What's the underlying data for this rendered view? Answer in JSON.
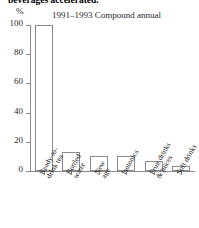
{
  "headline": "beverages accelerated.",
  "unit_label": "%",
  "subtitle": "1991–1993 Compound annual",
  "axis": {
    "y_ticks": [
      "100",
      "80",
      "60",
      "40",
      "20",
      "0"
    ]
  },
  "chart_data": {
    "type": "bar",
    "title": "beverages accelerated.",
    "subtitle": "1991–1993 Compound annual",
    "xlabel": "",
    "ylabel": "%",
    "ylim": [
      0,
      100
    ],
    "yticks": [
      0,
      20,
      40,
      60,
      80,
      100
    ],
    "grid": false,
    "legend": "none",
    "categories": [
      "Ready-to-drink tea",
      "Bottled water",
      "New age",
      "Isotonics",
      "Fruit drinks & juices",
      "Soft drinks"
    ],
    "category_lines": [
      [
        "Ready-to-",
        "drink tea"
      ],
      [
        "Bottled",
        "water"
      ],
      [
        "New",
        "age"
      ],
      [
        "Isotonics",
        ""
      ],
      [
        "Fruit drinks",
        "& juices"
      ],
      [
        "Soft drinks",
        ""
      ]
    ],
    "values": [
      100,
      13,
      10,
      10,
      7,
      3.5
    ]
  },
  "colors": {
    "bar_fill": "#ffffff",
    "bar_stroke": "#8c8c8c",
    "axis": "#8c8c8c",
    "text": "#1a1a1a"
  }
}
